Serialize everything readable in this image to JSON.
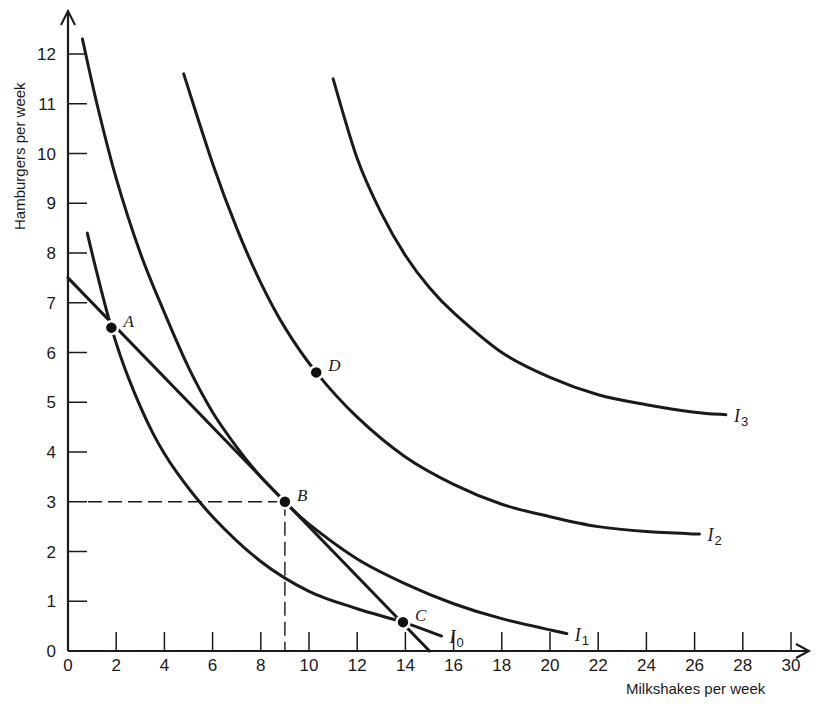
{
  "chart_data": {
    "type": "line",
    "title": "",
    "xlabel": "Milkshakes per week",
    "ylabel": "Hamburgers per week",
    "xlim": [
      0,
      30
    ],
    "ylim": [
      0,
      12
    ],
    "grid": false,
    "x_ticks": [
      0,
      2,
      4,
      6,
      8,
      10,
      12,
      14,
      16,
      18,
      20,
      22,
      24,
      26,
      28,
      30
    ],
    "y_ticks": [
      0,
      1,
      2,
      3,
      4,
      5,
      6,
      7,
      8,
      9,
      10,
      11,
      12
    ],
    "series": [
      {
        "name": "I0",
        "label_main": "I",
        "label_sub": "0",
        "points": [
          [
            0.8,
            8.4
          ],
          [
            1.2,
            7.6
          ],
          [
            1.8,
            6.5
          ],
          [
            2.5,
            5.5
          ],
          [
            3.5,
            4.4
          ],
          [
            4.5,
            3.6
          ],
          [
            6,
            2.7
          ],
          [
            8,
            1.8
          ],
          [
            10,
            1.2
          ],
          [
            12,
            0.85
          ],
          [
            13.9,
            0.58
          ],
          [
            15.5,
            0.3
          ]
        ]
      },
      {
        "name": "I1",
        "label_main": "I",
        "label_sub": "1",
        "points": [
          [
            0.6,
            12.3
          ],
          [
            1.2,
            11.0
          ],
          [
            2,
            9.5
          ],
          [
            3,
            8.0
          ],
          [
            4,
            6.8
          ],
          [
            5,
            5.7
          ],
          [
            6,
            4.8
          ],
          [
            7,
            4.1
          ],
          [
            8,
            3.5
          ],
          [
            9,
            3.0
          ],
          [
            10,
            2.55
          ],
          [
            12,
            1.85
          ],
          [
            14,
            1.35
          ],
          [
            16,
            0.95
          ],
          [
            18,
            0.65
          ],
          [
            20.7,
            0.35
          ]
        ]
      },
      {
        "name": "I2",
        "label_main": "I",
        "label_sub": "2",
        "points": [
          [
            4.8,
            11.6
          ],
          [
            6,
            9.8
          ],
          [
            7,
            8.5
          ],
          [
            8,
            7.4
          ],
          [
            9,
            6.5
          ],
          [
            10.3,
            5.6
          ],
          [
            12,
            4.7
          ],
          [
            14,
            3.9
          ],
          [
            16,
            3.35
          ],
          [
            18,
            2.95
          ],
          [
            20,
            2.7
          ],
          [
            22,
            2.5
          ],
          [
            24,
            2.4
          ],
          [
            26.2,
            2.35
          ]
        ]
      },
      {
        "name": "I3",
        "label_main": "I",
        "label_sub": "3",
        "points": [
          [
            11.0,
            11.5
          ],
          [
            12,
            9.9
          ],
          [
            13,
            8.8
          ],
          [
            14,
            7.95
          ],
          [
            15,
            7.3
          ],
          [
            16,
            6.8
          ],
          [
            18,
            6.0
          ],
          [
            20,
            5.5
          ],
          [
            22,
            5.15
          ],
          [
            24,
            4.95
          ],
          [
            26,
            4.8
          ],
          [
            27.3,
            4.75
          ]
        ]
      },
      {
        "name": "Budget line",
        "points": [
          [
            0,
            7.5
          ],
          [
            15,
            0
          ]
        ]
      }
    ],
    "points": [
      {
        "label": "A",
        "x": 1.8,
        "y": 6.5
      },
      {
        "label": "B",
        "x": 9,
        "y": 3
      },
      {
        "label": "C",
        "x": 13.9,
        "y": 0.58
      },
      {
        "label": "D",
        "x": 10.3,
        "y": 5.6
      }
    ],
    "guides": [
      {
        "type": "dashed-horizontal",
        "y": 3,
        "x_from": 0,
        "x_to": 9
      },
      {
        "type": "dashed-vertical",
        "x": 9,
        "y_from": 0,
        "y_to": 3
      }
    ]
  }
}
